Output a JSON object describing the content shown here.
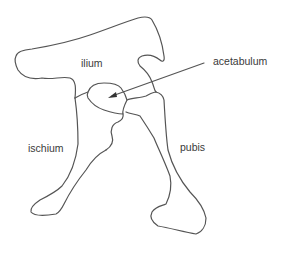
{
  "diagram": {
    "type": "anatomical-line-drawing",
    "stroke_color": "#555555",
    "background": "#ffffff",
    "labels": {
      "ilium": "ilium",
      "acetabulum": "acetabulum",
      "ischium": "ischium",
      "pubis": "pubis"
    },
    "pointer": {
      "from_label": "acetabulum",
      "target": "acetabulum-socket",
      "style": "arrow"
    }
  }
}
